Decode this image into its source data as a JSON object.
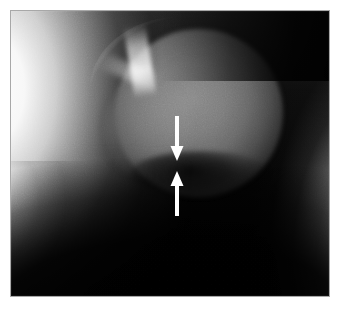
{
  "figure": {
    "kind": "radiograph",
    "modality_label": "X-ray",
    "view_label": "hip joint lateral projection",
    "width_px": 339,
    "height_px": 311,
    "background_color": "#ffffff",
    "frame_color": "#a8a8a8",
    "plate_color": "#000000"
  },
  "plate": {
    "left_px": 10,
    "top_px": 10,
    "width_px": 320,
    "height_px": 287
  },
  "anatomy": {
    "regions": [
      {
        "name": "left-bright-band",
        "label": "iliac soft tissue band",
        "tone": "bright"
      },
      {
        "name": "right-bright-band",
        "label": "lateral soft tissue band",
        "tone": "bright"
      },
      {
        "name": "femoral-head",
        "label": "femoral head",
        "tone": "mid-grey"
      },
      {
        "name": "acetabular-roof",
        "label": "acetabular roof arc",
        "tone": "bright rim"
      },
      {
        "name": "medial-lobe",
        "label": "medial rounded lobe",
        "tone": "mid-grey"
      },
      {
        "name": "joint-space",
        "label": "joint space / lucent band",
        "tone": "dark"
      },
      {
        "name": "bottom-black",
        "label": "inferior radiolucent field",
        "tone": "black"
      }
    ]
  },
  "annotations": {
    "color": "#ffffff",
    "arrows": [
      {
        "name": "upper-arrow",
        "direction": "down",
        "tail_x": 177,
        "tail_y": 116,
        "tip_x": 177,
        "tip_y": 161,
        "shaft_width": 4,
        "head_width": 13,
        "head_length": 15
      },
      {
        "name": "lower-arrow",
        "direction": "up",
        "tail_x": 177,
        "tail_y": 216,
        "tip_x": 177,
        "tip_y": 171,
        "shaft_width": 4,
        "head_width": 13,
        "head_length": 15
      }
    ]
  }
}
